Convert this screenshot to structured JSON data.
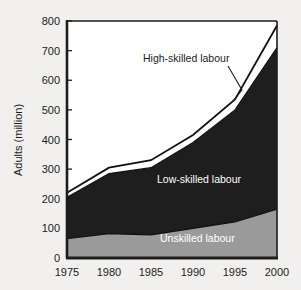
{
  "chart_data": {
    "type": "area",
    "title": "",
    "subtitle": "",
    "xlabel": "",
    "ylabel": "Adults (million)",
    "x": [
      1975,
      1980,
      1985,
      1990,
      1995,
      2000
    ],
    "xtick_labels": [
      "1975",
      "1980",
      "1985",
      "1990",
      "1995",
      "2000"
    ],
    "xlim": [
      1975,
      2000
    ],
    "ylim": [
      0,
      800
    ],
    "ytick_labels": [
      "0",
      "100",
      "200",
      "300",
      "400",
      "500",
      "600",
      "700",
      "800"
    ],
    "yticks": [
      0,
      100,
      200,
      300,
      400,
      500,
      600,
      700,
      800
    ],
    "grid": false,
    "legend_position": "inline-annotations",
    "stacked": true,
    "series": [
      {
        "name": "Unskilled labour",
        "values": [
          65,
          82,
          78,
          100,
          122,
          165
        ],
        "cumulative_top": [
          65,
          82,
          78,
          100,
          122,
          165
        ],
        "color": "#9a9a9a",
        "label_color": "#ffffff"
      },
      {
        "name": "Low-skilled labour",
        "values": [
          140,
          203,
          227,
          290,
          378,
          545
        ],
        "cumulative_top": [
          205,
          285,
          305,
          390,
          500,
          710
        ],
        "color": "#1e1e1e",
        "label_color": "#ffffff"
      },
      {
        "name": "High-skilled labour",
        "values": [
          15,
          20,
          25,
          25,
          35,
          75
        ],
        "cumulative_top": [
          220,
          305,
          330,
          415,
          535,
          785
        ],
        "color": "#ffffff",
        "label_color": "#1c1c1c"
      }
    ],
    "annotations": [
      {
        "text": "High-skilled labour",
        "target_series": "High-skilled labour",
        "placement": "outside-upper-left",
        "leader_line": true
      },
      {
        "text": "Low-skilled labour",
        "target_series": "Low-skilled labour",
        "placement": "inside",
        "leader_line": false
      },
      {
        "text": "Unskilled labour",
        "target_series": "Unskilled labour",
        "placement": "inside",
        "leader_line": false
      }
    ]
  },
  "colors": {
    "background": "#f1f0ee",
    "axis": "#1c1c1c",
    "plot_area": "#ffffff",
    "unskilled": "#9a9a9a",
    "low_skilled": "#1e1e1e",
    "high_skilled": "#ffffff"
  }
}
